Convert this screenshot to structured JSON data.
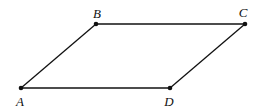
{
  "diagram": {
    "type": "parallelogram",
    "points": [
      {
        "name": "A",
        "x": 21,
        "y": 88,
        "label_x": 20,
        "label_y": 106
      },
      {
        "name": "B",
        "x": 96,
        "y": 24,
        "label_x": 97,
        "label_y": 18
      },
      {
        "name": "C",
        "x": 245,
        "y": 24,
        "label_x": 243,
        "label_y": 17
      },
      {
        "name": "D",
        "x": 170,
        "y": 88,
        "label_x": 169,
        "label_y": 106
      }
    ],
    "edges": [
      [
        "A",
        "B"
      ],
      [
        "B",
        "C"
      ],
      [
        "C",
        "D"
      ],
      [
        "D",
        "A"
      ]
    ],
    "stroke_color": "#111111"
  }
}
